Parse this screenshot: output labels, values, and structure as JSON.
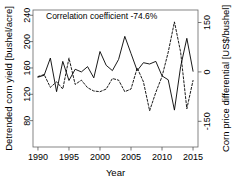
{
  "chart_data": {
    "type": "line",
    "title": "",
    "annotation": "Correlation coefficient -74.6%",
    "xlabel": "Year",
    "ylabel_left": "Detrended corn yield [bushel/acre]",
    "ylabel_right": "Corn price differential [US$/bushel]",
    "xlim": [
      1989.2,
      2015.8
    ],
    "ylim_left": [
      40,
      248
    ],
    "ylim_right": [
      -228,
      188
    ],
    "xticks": [
      1990,
      1995,
      2000,
      2005,
      2010,
      2015
    ],
    "yticks_left": [
      80,
      120,
      160,
      200,
      240
    ],
    "yticks_right": [
      -150,
      0,
      150
    ],
    "grid": false,
    "legend_position": "none",
    "x": [
      1990,
      1991,
      1992,
      1993,
      1994,
      1995,
      1996,
      1997,
      1998,
      1999,
      2000,
      2001,
      2002,
      2003,
      2004,
      2005,
      2006,
      2007,
      2008,
      2009,
      2010,
      2011,
      2012,
      2013,
      2014,
      2015
    ],
    "series": [
      {
        "name": "Detrended corn yield",
        "axis": "left",
        "style": "solid",
        "color": "#000000",
        "values": [
          146,
          149,
          175,
          124,
          170,
          141,
          158,
          154,
          162,
          145,
          185,
          164,
          156,
          173,
          208,
          182,
          156,
          168,
          166,
          170,
          148,
          142,
          96,
          162,
          205,
          155
        ]
      },
      {
        "name": "Corn price differential",
        "axis": "right",
        "style": "dashed",
        "color": "#000000",
        "values": [
          -14,
          -8,
          -47,
          -30,
          -52,
          42,
          -38,
          -25,
          -48,
          -58,
          -60,
          -52,
          -20,
          -25,
          -60,
          -52,
          12,
          -30,
          -118,
          -62,
          -14,
          60,
          152,
          60,
          -112,
          -26
        ]
      }
    ]
  }
}
